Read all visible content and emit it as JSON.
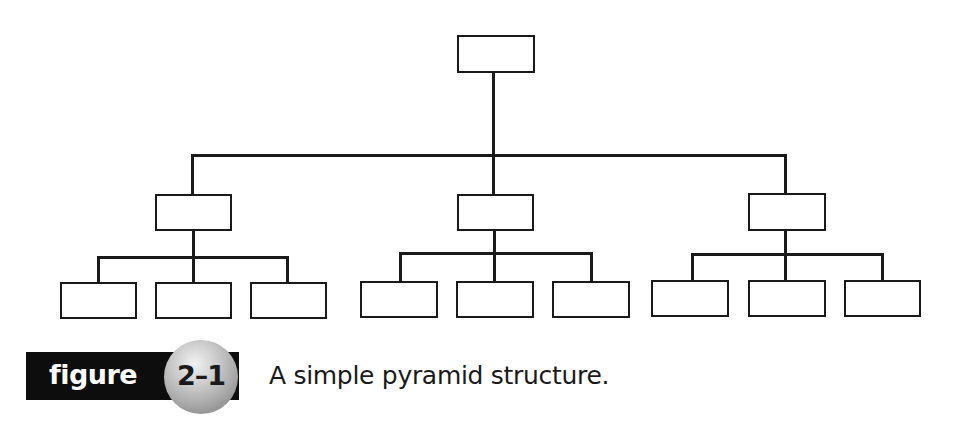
{
  "figure": {
    "label_word": "figure",
    "number": "2–1",
    "caption": "A simple pyramid structure."
  },
  "diagram": {
    "type": "hierarchy",
    "levels": [
      {
        "level": 0,
        "node_count": 1
      },
      {
        "level": 1,
        "node_count": 3
      },
      {
        "level": 2,
        "node_count": 9
      }
    ],
    "nodes": [
      {
        "id": "root",
        "level": 0,
        "label": ""
      },
      {
        "id": "mid-left",
        "level": 1,
        "parent": "root",
        "label": ""
      },
      {
        "id": "mid-center",
        "level": 1,
        "parent": "root",
        "label": ""
      },
      {
        "id": "mid-right",
        "level": 1,
        "parent": "root",
        "label": ""
      },
      {
        "id": "leaf-1",
        "level": 2,
        "parent": "mid-left",
        "label": ""
      },
      {
        "id": "leaf-2",
        "level": 2,
        "parent": "mid-left",
        "label": ""
      },
      {
        "id": "leaf-3",
        "level": 2,
        "parent": "mid-left",
        "label": ""
      },
      {
        "id": "leaf-4",
        "level": 2,
        "parent": "mid-center",
        "label": ""
      },
      {
        "id": "leaf-5",
        "level": 2,
        "parent": "mid-center",
        "label": ""
      },
      {
        "id": "leaf-6",
        "level": 2,
        "parent": "mid-center",
        "label": ""
      },
      {
        "id": "leaf-7",
        "level": 2,
        "parent": "mid-right",
        "label": ""
      },
      {
        "id": "leaf-8",
        "level": 2,
        "parent": "mid-right",
        "label": ""
      },
      {
        "id": "leaf-9",
        "level": 2,
        "parent": "mid-right",
        "label": ""
      }
    ],
    "colors": {
      "stroke": "#1a1a1a",
      "fill": "#ffffff",
      "label_bar": "#0d0d0d",
      "label_text": "#ffffff"
    }
  }
}
